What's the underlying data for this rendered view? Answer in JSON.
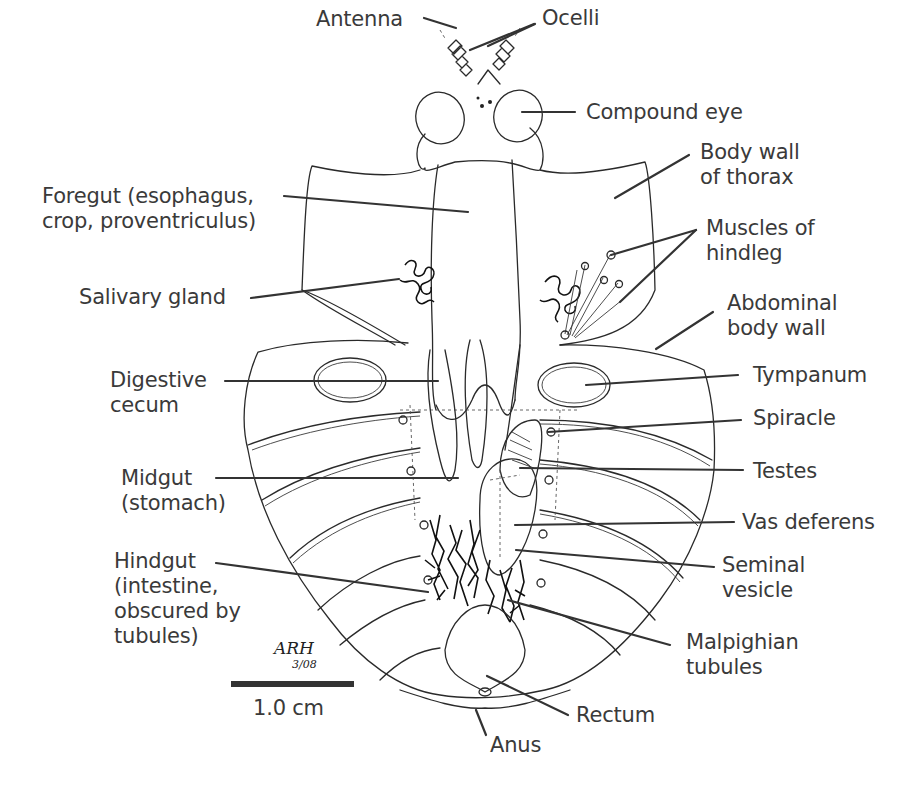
{
  "diagram": {
    "labels": {
      "antenna": "Antenna",
      "ocelli": "Ocelli",
      "compound_eye": "Compound eye",
      "body_wall_thorax": "Body wall\nof thorax",
      "foregut": "Foregut (esophagus,\ncrop, proventriculus)",
      "muscles_hindleg": "Muscles of\nhindleg",
      "salivary_gland": "Salivary gland",
      "abdominal_body_wall": "Abdominal\nbody wall",
      "digestive_cecum": "Digestive\ncecum",
      "tympanum": "Tympanum",
      "spiracle": "Spiracle",
      "midgut": "Midgut\n(stomach)",
      "testes": "Testes",
      "vas_deferens": "Vas deferens",
      "seminal_vesicle": "Seminal\nvesicle",
      "hindgut": "Hindgut\n(intestine,\nobscured by\ntubules)",
      "malpighian_tubules": "Malpighian\ntubules",
      "rectum": "Rectum",
      "anus": "Anus"
    },
    "scale_bar": {
      "label": "1.0 cm"
    },
    "signature": {
      "initials": "ARH",
      "date": "3/08"
    },
    "colors": {
      "ink": "#2a2a2a",
      "text": "#3a3a3a",
      "background": "#ffffff"
    }
  }
}
